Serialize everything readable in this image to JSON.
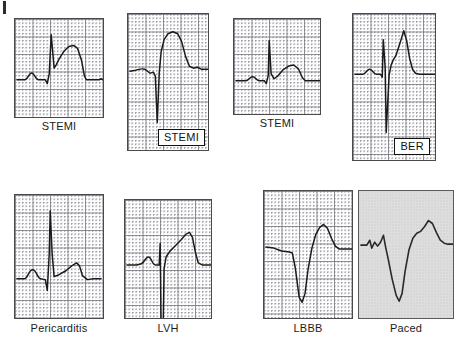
{
  "figure": {
    "panel_count": 8,
    "rows": 2,
    "columns": 4
  },
  "panels": [
    {
      "id": "panel-stemi-1",
      "label": "STEMI",
      "label_placement": "below",
      "background": "grid",
      "grid_color": "#8a8a92",
      "trace_color": "#1a1a1a",
      "row": 1,
      "column": 1,
      "description": "Convex upward ST elevation with tall R wave and broad hyperacute T wave",
      "path": "M 2,62 L 10,62 C 13,62 14,55 17,55 C 20,55 21,62 24,62 L 31,62 L 33,66 L 35,56 L 37,16 L 40,50 L 42,47 L 45,41 L 50,33 L 55,28 L 60,27 L 64,30 L 68,42 L 71,58 L 73,62 L 86,62 L 88,61 L 90,62"
    },
    {
      "id": "panel-stemi-2",
      "label": "STEMI",
      "label_placement": "inset-bottom-right",
      "background": "grid",
      "grid_color": "#8a8a92",
      "trace_color": "#1a1a1a",
      "row": 1,
      "column": 2,
      "description": "Deep QS complex followed by marked coved ST elevation",
      "path": "M 2,58 L 8,57 C 12,56 14,55 17,56 C 20,57 21,60 23,60 L 26,59 L 28,63 L 30,110 L 32,60 L 34,38 L 37,26 L 41,20 L 46,18 L 51,20 L 55,28 L 59,43 L 63,53 L 67,55 L 71,54 L 75,56 L 82,56"
    },
    {
      "id": "panel-stemi-3",
      "label": "STEMI",
      "label_placement": "below",
      "background": "grid",
      "grid_color": "#8a8a92",
      "trace_color": "#1a1a1a",
      "row": 1,
      "column": 3,
      "description": "Narrow R wave with modest ST elevation and broad T wave",
      "path": "M 2,63 L 12,63 C 15,63 16,59 19,59 C 22,59 23,63 26,63 L 31,63 L 33,66 L 35,58 L 36,22 L 38,56 L 41,61 L 45,58 L 50,52 L 56,48 L 61,47 L 66,51 L 70,60 L 73,63 L 88,63"
    },
    {
      "id": "panel-ber",
      "label": "BER",
      "label_placement": "inset-bottom-right",
      "background": "grid",
      "grid_color": "#8a8a92",
      "trace_color": "#1a1a1a",
      "row": 1,
      "column": 4,
      "description": "Benign early repolarisation: tall slender R, deep S, J-point notch and concave ST elevation with peaked T",
      "path": "M 2,61 L 10,61 C 13,61 14,56 17,56 C 20,56 21,61 24,61 L 28,61 L 30,64 L 31,26 L 33,55 L 34,120 L 37,62 L 39,52 L 41,47 L 44,42 L 48,30 L 52,17 L 55,27 L 58,45 L 61,56 L 64,60 L 68,61 L 84,61"
    },
    {
      "id": "panel-pericarditis",
      "label": "Pericarditis",
      "label_placement": "below",
      "background": "grid",
      "grid_color": "#8a8a92",
      "trace_color": "#1a1a1a",
      "row": 2,
      "column": 1,
      "description": "Widespread concave saddle-shaped ST elevation with upright T waves",
      "path": "M 2,85 L 10,85 C 13,85 14,76 18,76 C 22,76 23,85 26,85 L 31,86 L 33,97 L 35,60 L 36,16 L 38,60 L 40,83 L 45,81 L 52,77 L 58,72 L 63,69 L 66,72 L 69,82 L 74,86 L 80,85 L 88,85"
    },
    {
      "id": "panel-lvh",
      "label": "LVH",
      "label_placement": "below",
      "background": "grid",
      "grid_color": "#8a8a92",
      "trace_color": "#1a1a1a",
      "row": 2,
      "column": 2,
      "description": "Left ventricular hypertrophy: very deep S wave running off scale with discordant ST elevation and asymmetric T",
      "path": "M 2,66 L 12,66 L 16,65 C 19,65 21,58 24,58 C 27,58 28,66 31,66 L 35,66 L 36,44 L 37,135 L 39,135 L 40,70 L 42,58 L 46,52 L 51,47 L 57,41 L 62,35 L 66,33 L 69,38 L 72,53 L 75,64 L 79,66 L 88,66"
    },
    {
      "id": "panel-lbbb",
      "label": "LBBB",
      "label_placement": "below",
      "background": "grid",
      "grid_color": "#8a8a92",
      "trace_color": "#1a1a1a",
      "row": 2,
      "column": 3,
      "description": "Left bundle branch block: broad deep QS complex with discordant ST elevation and tall T wave",
      "path": "M 2,57 L 10,58 L 18,61 L 26,62 L 29,63 L 32,78 L 36,108 L 39,113 L 42,104 L 45,80 L 49,58 L 53,44 L 57,37 L 61,34 L 65,38 L 69,48 L 73,56 L 77,59 L 82,59 L 90,59"
    },
    {
      "id": "panel-paced",
      "label": "Paced",
      "label_placement": "below",
      "background": "plain-gray",
      "grid_color": "none",
      "trace_color": "#2a2a2a",
      "row": 2,
      "column": 4,
      "description": "Ventricular paced rhythm: pacing spike then wide QS complex with discordant ST elevation and tall T wave",
      "path": "M 2,55 L 8,55 L 11,50 L 13,58 L 16,52 L 19,56 L 22,52 L 25,45 L 27,56 L 30,70 L 34,90 L 38,106 L 41,112 L 44,104 L 47,82 L 51,60 L 55,48 L 59,43 L 63,41 L 67,36 L 71,30 L 75,33 L 79,42 L 83,50 L 87,53 L 91,54 L 96,54"
    }
  ],
  "labels": {
    "stemi": "STEMI",
    "ber": "BER",
    "pericarditis": "Pericarditis",
    "lvh": "LVH",
    "lbbb": "LBBB",
    "paced": "Paced"
  }
}
